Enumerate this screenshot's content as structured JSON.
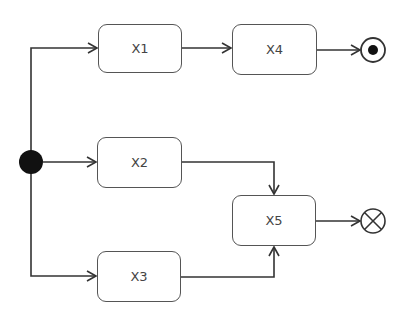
{
  "diagram": {
    "type": "UML activity diagram",
    "nodes": [
      {
        "id": "X1",
        "label": "X1"
      },
      {
        "id": "X2",
        "label": "X2"
      },
      {
        "id": "X3",
        "label": "X3"
      },
      {
        "id": "X4",
        "label": "X4"
      },
      {
        "id": "X5",
        "label": "X5"
      }
    ],
    "start": "initial-node",
    "ends": {
      "activity_final": "after X4",
      "flow_final": "after X5"
    },
    "edges": [
      [
        "start",
        "X1"
      ],
      [
        "start",
        "X2"
      ],
      [
        "start",
        "X3"
      ],
      [
        "X1",
        "X4"
      ],
      [
        "X4",
        "activity-final"
      ],
      [
        "X2",
        "X5"
      ],
      [
        "X3",
        "X5"
      ],
      [
        "X5",
        "flow-final"
      ]
    ]
  },
  "colors": {
    "stroke": "#333333",
    "text": "#444444"
  }
}
